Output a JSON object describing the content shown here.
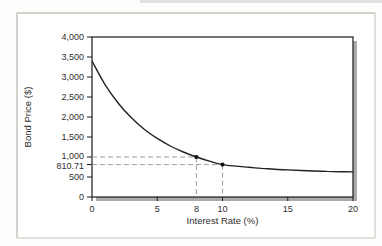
{
  "figure": {
    "background": "#fdfdfc",
    "panel_border_color": "#d2d2cc",
    "top_artifact_color": "#c9c9c9"
  },
  "chart_data": {
    "type": "line",
    "title": "",
    "xlabel": "Interest Rate (%)",
    "ylabel": "Bond Price ($)",
    "xlim": [
      0,
      20
    ],
    "ylim": [
      0,
      4000
    ],
    "grid": false,
    "legend": null,
    "frame_color": "#1a1a1a",
    "shadow_color": "#ababab",
    "curve_color": "#222222",
    "guide_color": "#9c9c9c",
    "point_color": "#111111",
    "x_ticks": [
      {
        "value": 0,
        "label": "0",
        "stub": true
      },
      {
        "value": 5,
        "label": "5",
        "stub": true
      },
      {
        "value": 8,
        "label": "8",
        "stub": false
      },
      {
        "value": 10,
        "label": "10",
        "stub": true
      },
      {
        "value": 15,
        "label": "15",
        "stub": true
      },
      {
        "value": 20,
        "label": "20",
        "stub": true
      }
    ],
    "y_ticks": [
      {
        "value": 0,
        "label": "0",
        "stub": true
      },
      {
        "value": 500,
        "label": "500",
        "stub": true
      },
      {
        "value": 810.71,
        "label": "810.71",
        "stub": true,
        "dy": 4
      },
      {
        "value": 1000,
        "label": "1,000",
        "stub": true,
        "dy": 2
      },
      {
        "value": 1500,
        "label": "1,500",
        "stub": true
      },
      {
        "value": 2000,
        "label": "2,000",
        "stub": true
      },
      {
        "value": 2500,
        "label": "2,500",
        "stub": true
      },
      {
        "value": 3000,
        "label": "3,000",
        "stub": true
      },
      {
        "value": 3500,
        "label": "3,500",
        "stub": true
      },
      {
        "value": 4000,
        "label": "4,000",
        "stub": true
      }
    ],
    "series": [
      {
        "name": "bond-price-curve",
        "x": [
          0,
          1,
          2,
          3,
          4,
          5,
          6,
          7,
          8,
          9,
          10,
          11,
          12,
          13,
          14,
          15,
          16,
          17,
          18,
          19,
          20
        ],
        "y": [
          3400,
          2810,
          2350,
          1985,
          1695,
          1465,
          1275,
          1125,
          1000,
          897,
          810.71,
          772,
          742,
          716,
          695,
          678,
          663,
          651,
          641,
          633,
          627
        ]
      }
    ],
    "annotated_points": [
      {
        "x": 8,
        "y": 1000,
        "x_label": "8",
        "y_label": "1,000"
      },
      {
        "x": 10,
        "y": 810.71,
        "x_label": "10",
        "y_label": "810.71"
      }
    ]
  }
}
